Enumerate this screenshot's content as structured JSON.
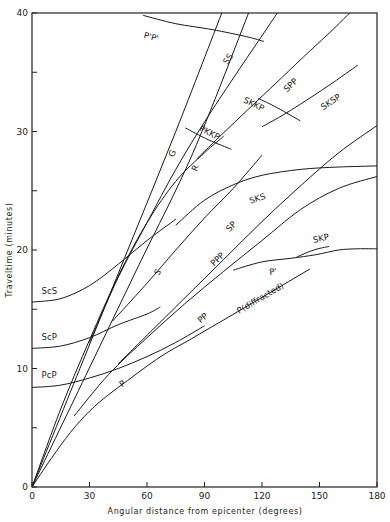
{
  "chart_data": {
    "type": "line",
    "title": "",
    "xlabel": "Angular distance from epicenter (degrees)",
    "ylabel": "Traveltime (minutes)",
    "xlim": [
      0,
      180
    ],
    "ylim": [
      0,
      40
    ],
    "xticks": [
      0,
      30,
      60,
      90,
      120,
      150,
      180
    ],
    "xtick_labels": [
      "0",
      "30",
      "60",
      "90",
      "120",
      "150",
      "180"
    ],
    "yticks": [
      0,
      5,
      10,
      15,
      20,
      25,
      30,
      35,
      40
    ],
    "ytick_labels": [
      "0",
      "",
      "10",
      "",
      "20",
      "",
      "30",
      "",
      "40"
    ],
    "grid": false,
    "legend": "none",
    "series": [
      {
        "name": "P",
        "label": "P",
        "label_at": [
          47,
          8.4
        ],
        "points": [
          [
            0,
            0
          ],
          [
            10,
            2.4
          ],
          [
            20,
            4.6
          ],
          [
            30,
            6.4
          ],
          [
            40,
            7.8
          ],
          [
            50,
            9.0
          ],
          [
            60,
            10.2
          ],
          [
            70,
            11.3
          ],
          [
            82,
            12.4
          ]
        ]
      },
      {
        "name": "P(diffracted)",
        "label": "P(diffracted)",
        "label_at": [
          108,
          14.6
        ],
        "points": [
          [
            82,
            12.4
          ],
          [
            100,
            14.1
          ],
          [
            120,
            16.0
          ],
          [
            145,
            18.4
          ]
        ]
      },
      {
        "name": "PcP",
        "label": "PcP",
        "label_at": [
          5,
          9.2
        ],
        "points": [
          [
            0,
            8.4
          ],
          [
            15,
            8.6
          ],
          [
            30,
            9.2
          ],
          [
            45,
            10.0
          ],
          [
            60,
            11.0
          ],
          [
            75,
            12.2
          ],
          [
            90,
            13.6
          ]
        ]
      },
      {
        "name": "ScP",
        "label": "ScP",
        "label_at": [
          5,
          12.4
        ],
        "points": [
          [
            0,
            11.7
          ],
          [
            15,
            11.9
          ],
          [
            30,
            12.6
          ],
          [
            45,
            13.7
          ],
          [
            60,
            14.6
          ],
          [
            67,
            15.2
          ]
        ]
      },
      {
        "name": "ScS",
        "label": "ScS",
        "label_at": [
          5,
          16.3
        ],
        "points": [
          [
            0,
            15.6
          ],
          [
            15,
            15.9
          ],
          [
            30,
            17.0
          ],
          [
            45,
            18.8
          ],
          [
            60,
            20.8
          ],
          [
            75,
            22.6
          ]
        ]
      },
      {
        "name": "PP",
        "label": "PP",
        "label_at": [
          88,
          13.8
        ],
        "points": [
          [
            22,
            6.0
          ],
          [
            40,
            9.5
          ],
          [
            60,
            12.6
          ],
          [
            80,
            15.5
          ],
          [
            100,
            18.2
          ],
          [
            120,
            20.8
          ],
          [
            140,
            23.4
          ],
          [
            160,
            25.2
          ],
          [
            180,
            26.2
          ]
        ]
      },
      {
        "name": "PPP",
        "label": "PPP",
        "label_at": [
          95,
          18.6
        ],
        "points": [
          [
            45,
            10.4
          ],
          [
            60,
            12.8
          ],
          [
            80,
            16.0
          ],
          [
            100,
            19.2
          ],
          [
            120,
            22.4
          ],
          [
            140,
            25.4
          ],
          [
            160,
            28.2
          ],
          [
            180,
            30.5
          ]
        ]
      },
      {
        "name": "S",
        "label": "S",
        "label_at": [
          66,
          17.8
        ],
        "points": [
          [
            0,
            0
          ],
          [
            15,
            6.6
          ],
          [
            30,
            12.4
          ],
          [
            45,
            17.8
          ],
          [
            60,
            22.3
          ],
          [
            75,
            25.8
          ],
          [
            90,
            28.2
          ],
          [
            100,
            29.6
          ]
        ]
      },
      {
        "name": "SP",
        "label": "SP",
        "label_at": [
          103,
          21.5
        ],
        "points": [
          [
            42,
            14.0
          ],
          [
            60,
            17.2
          ],
          [
            75,
            20.0
          ],
          [
            90,
            22.7
          ],
          [
            105,
            25.2
          ],
          [
            120,
            28.0
          ]
        ]
      },
      {
        "name": "SKS",
        "label": "SKS",
        "label_at": [
          114,
          23.9
        ],
        "points": [
          [
            75,
            22.1
          ],
          [
            90,
            24.2
          ],
          [
            105,
            25.5
          ],
          [
            120,
            26.3
          ],
          [
            140,
            26.8
          ],
          [
            160,
            27.0
          ],
          [
            180,
            27.1
          ]
        ]
      },
      {
        "name": "SKP",
        "label": "SKP",
        "label_at": [
          147,
          20.6
        ],
        "points": [
          [
            138,
            19.4
          ],
          [
            147,
            20.0
          ],
          [
            155,
            20.3
          ]
        ]
      },
      {
        "name": "P'",
        "label": "P'",
        "label_at": [
          124,
          17.9
        ],
        "points": [
          [
            105,
            18.3
          ],
          [
            120,
            19.0
          ],
          [
            135,
            19.3
          ],
          [
            148,
            19.6
          ],
          [
            160,
            20.0
          ],
          [
            170,
            20.1
          ],
          [
            180,
            20.1
          ]
        ]
      },
      {
        "name": "SS",
        "label": "SS",
        "label_at": [
          102,
          35.6
        ],
        "points": [
          [
            30,
            12.2
          ],
          [
            45,
            17.7
          ],
          [
            60,
            22.3
          ],
          [
            75,
            26.8
          ],
          [
            90,
            30.8
          ],
          [
            105,
            34.5
          ],
          [
            118,
            37.6
          ],
          [
            128,
            40.0
          ]
        ]
      },
      {
        "name": "SPP",
        "label": "SPP",
        "label_at": [
          133,
          33.3
        ],
        "points": [
          [
            86,
            27.7
          ],
          [
            100,
            29.9
          ],
          [
            115,
            32.2
          ],
          [
            130,
            34.5
          ],
          [
            145,
            36.8
          ],
          [
            157,
            38.6
          ],
          [
            170,
            40.7
          ]
        ]
      },
      {
        "name": "SKSP",
        "label": "SKSP",
        "label_at": [
          152,
          31.8
        ],
        "points": [
          [
            120,
            30.4
          ],
          [
            130,
            31.3
          ],
          [
            140,
            32.3
          ],
          [
            155,
            33.9
          ],
          [
            170,
            35.6
          ]
        ]
      },
      {
        "name": "SKKP",
        "label": "SKKP",
        "label_at": [
          110,
          32.5
        ],
        "points": [
          [
            118,
            32.8
          ],
          [
            128,
            32.0
          ],
          [
            140,
            30.9
          ]
        ]
      },
      {
        "name": "PKKP",
        "label": "PKKP",
        "label_at": [
          87,
          30.1
        ],
        "points": [
          [
            80,
            30.3
          ],
          [
            92,
            29.3
          ],
          [
            104,
            28.5
          ]
        ]
      },
      {
        "name": "G",
        "label": "G",
        "label_at": [
          74,
          27.8
        ],
        "points": [
          [
            0,
            0
          ],
          [
            25,
            10.0
          ],
          [
            50,
            20.0
          ],
          [
            75,
            30.0
          ],
          [
            99,
            40.0
          ]
        ]
      },
      {
        "name": "R",
        "label": "R",
        "label_at": [
          86,
          26.6
        ],
        "points": [
          [
            0,
            0
          ],
          [
            28,
            9.4
          ],
          [
            56,
            18.8
          ],
          [
            84,
            28.2
          ],
          [
            113,
            40.0
          ]
        ]
      },
      {
        "name": "P'P'",
        "label": "P'P'",
        "label_at": [
          58,
          37.9
        ],
        "points": [
          [
            58,
            39.8
          ],
          [
            75,
            39.1
          ],
          [
            94,
            38.6
          ],
          [
            112,
            38.0
          ],
          [
            121,
            37.6
          ]
        ]
      }
    ]
  }
}
